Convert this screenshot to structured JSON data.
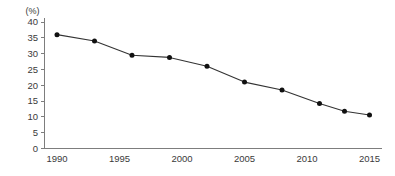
{
  "chart_data": {
    "type": "line",
    "title": "",
    "subtitle": "",
    "xlabel": "",
    "ylabel": "",
    "unit_label": "(%)",
    "x": [
      1990,
      1993,
      1996,
      1999,
      2002,
      2005,
      2008,
      2011,
      2013,
      2015
    ],
    "values": [
      36.0,
      34.0,
      29.5,
      28.8,
      26.0,
      21.0,
      18.5,
      14.2,
      11.8,
      10.6
    ],
    "series": [
      {
        "name": "",
        "values": [
          36.0,
          34.0,
          29.5,
          28.8,
          26.0,
          21.0,
          18.5,
          14.2,
          11.8,
          10.6
        ]
      }
    ],
    "xlim": [
      1989,
      2016
    ],
    "ylim": [
      0,
      40
    ],
    "x_ticks": [
      1990,
      1995,
      2000,
      2005,
      2010,
      2015
    ],
    "x_tick_labels": [
      "1990",
      "1995",
      "2000",
      "2005",
      "2010",
      "2015"
    ],
    "y_ticks": [
      0,
      5,
      10,
      15,
      20,
      25,
      30,
      35,
      40
    ],
    "y_tick_labels": [
      "0",
      "5",
      "10",
      "15",
      "20",
      "25",
      "30",
      "35",
      "40"
    ],
    "grid": false,
    "legend": false,
    "legend_position": "none",
    "marker": "circle",
    "colors": {
      "line": "#333333",
      "marker": "#111111",
      "axis": "#7d7d7d",
      "text": "#3a3a3a",
      "background": "#ffffff"
    }
  }
}
